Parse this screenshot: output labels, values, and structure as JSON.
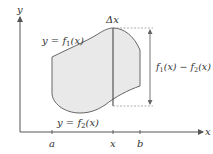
{
  "diagram": {
    "colors": {
      "axis": "#555555",
      "region_fill": "#e9e9e9",
      "region_stroke": "#666666",
      "strip": "#555555",
      "dashed": "#999999",
      "text": "#333333"
    },
    "axes": {
      "x_label": "x",
      "y_label": "y"
    },
    "curves": {
      "upper_label_prefix": "y = ",
      "upper_func": "f",
      "upper_sub": "1",
      "upper_arg": "(x)",
      "lower_label_prefix": "y = ",
      "lower_func": "f",
      "lower_sub": "2",
      "lower_arg": "(x)"
    },
    "strip": {
      "width_label": "Δx"
    },
    "height_label": {
      "f1": "f",
      "s1": "1",
      "mid": "(x) − ",
      "f2": "f",
      "s2": "2",
      "end": "(x)"
    },
    "ticks": [
      {
        "label": "a",
        "x": 52
      },
      {
        "label": "x",
        "x": 113
      },
      {
        "label": "b",
        "x": 140
      }
    ]
  }
}
